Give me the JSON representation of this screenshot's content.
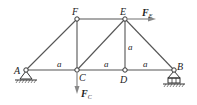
{
  "diagram": {
    "type": "truss",
    "nodes": [
      {
        "id": "A",
        "label": "A",
        "x": 26,
        "y": 70,
        "support": "pin"
      },
      {
        "id": "C",
        "label": "C",
        "x": 77,
        "y": 70
      },
      {
        "id": "D",
        "label": "D",
        "x": 125,
        "y": 70
      },
      {
        "id": "B",
        "label": "B",
        "x": 174,
        "y": 70,
        "support": "roller"
      },
      {
        "id": "F",
        "label": "F",
        "x": 77,
        "y": 19
      },
      {
        "id": "E",
        "label": "E",
        "x": 125,
        "y": 19
      }
    ],
    "members": [
      [
        "A",
        "C"
      ],
      [
        "C",
        "D"
      ],
      [
        "D",
        "B"
      ],
      [
        "F",
        "E"
      ],
      [
        "A",
        "F"
      ],
      [
        "F",
        "C"
      ],
      [
        "C",
        "E"
      ],
      [
        "E",
        "D"
      ],
      [
        "E",
        "B"
      ]
    ],
    "dimensions": [
      {
        "label": "a",
        "x": 59,
        "y": 67
      },
      {
        "label": "a",
        "x": 106,
        "y": 67
      },
      {
        "label": "a",
        "x": 145,
        "y": 67
      },
      {
        "label": "a",
        "x": 130,
        "y": 50
      }
    ],
    "forces": [
      {
        "label": "F",
        "subscript": "E",
        "node": "E",
        "direction": "right"
      },
      {
        "label": "F",
        "subscript": "C",
        "node": "C",
        "direction": "down"
      }
    ],
    "colors": {
      "line": "#555555",
      "support": "#333333",
      "arrow": "#888888"
    }
  }
}
